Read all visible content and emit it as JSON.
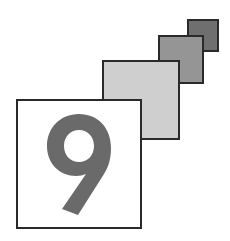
{
  "graphic": {
    "title": "Number 9 icon",
    "numeral": "9",
    "colors": {
      "numeral": "#6a6a6a",
      "border": "#2a2a2a",
      "square_light": "#cfcfcf",
      "square_mid": "#959595",
      "square_dark": "#6f6f6f",
      "box_fill": "#ffffff"
    }
  }
}
